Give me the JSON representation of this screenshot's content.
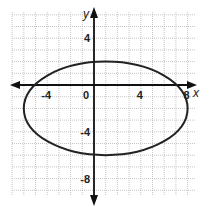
{
  "chart_data": {
    "type": "line",
    "title": "",
    "xlabel": "x",
    "ylabel": "y",
    "xlim": [
      -7,
      8.5
    ],
    "ylim": [
      -10,
      6
    ],
    "grid": true,
    "x_ticks": [
      -4,
      0,
      4,
      8
    ],
    "y_ticks": [
      4,
      -4,
      -8
    ],
    "tick_labels": {
      "x": [
        "-4",
        "0",
        "4",
        "8"
      ],
      "y": [
        "4",
        "-4",
        "-8"
      ]
    },
    "series": [
      {
        "name": "ellipse",
        "shape": "ellipse",
        "center": [
          1,
          -2
        ],
        "semi_axis_x": 7,
        "semi_axis_y": 4,
        "equation": "(x-1)^2/49 + (y+2)^2/16 = 1",
        "vertices": [
          [
            -6,
            -2
          ],
          [
            8,
            -2
          ]
        ],
        "co_vertices": [
          [
            1,
            2
          ],
          [
            1,
            -6
          ]
        ]
      }
    ],
    "colors": {
      "curve": "#222222",
      "axes": "#111111",
      "grid": "#b8b8b8"
    }
  }
}
